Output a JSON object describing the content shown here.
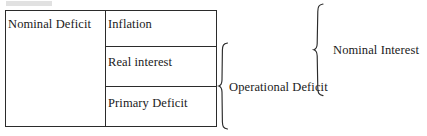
{
  "diagram": {
    "colors": {
      "line": "#2b2b2b",
      "text": "#1a1a1a",
      "background": "#ffffff"
    },
    "table": {
      "left_cell": {
        "label": "Nominal Deficit"
      },
      "rows": [
        {
          "label": "Inflation"
        },
        {
          "label": "Real interest"
        },
        {
          "label": "Primary Deficit"
        }
      ]
    },
    "braces": [
      {
        "name": "operational-deficit",
        "label": "Operational Deficit",
        "groups": [
          "Real interest",
          "Primary Deficit"
        ]
      },
      {
        "name": "nominal-interest",
        "label": "Nominal Interest",
        "groups": [
          "Inflation",
          "Real interest"
        ]
      }
    ]
  }
}
